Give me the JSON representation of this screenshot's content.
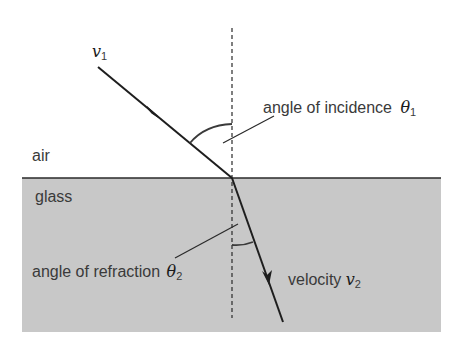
{
  "diagram": {
    "type": "refraction",
    "colors": {
      "glass_fill": "#c8c8c8",
      "line": "#1e1e1e",
      "text": "#3a3a3a",
      "background": "#ffffff"
    },
    "media": {
      "upper": "air",
      "lower": "glass"
    },
    "labels": {
      "v1_symbol": "v",
      "v1_sub": "1",
      "incidence_text": "angle of incidence",
      "theta1_symbol": "θ",
      "theta1_sub": "1",
      "refraction_text": "angle of refraction",
      "theta2_symbol": "θ",
      "theta2_sub": "2",
      "velocity_text": "velocity",
      "v2_symbol": "v",
      "v2_sub": "2"
    },
    "geometry": {
      "interface_y": 178,
      "normal_x": 232,
      "incident_ray": {
        "from": [
          98,
          67
        ],
        "to": [
          232,
          178
        ]
      },
      "refracted_ray": {
        "from": [
          232,
          178
        ],
        "to": [
          283,
          322
        ]
      }
    }
  }
}
